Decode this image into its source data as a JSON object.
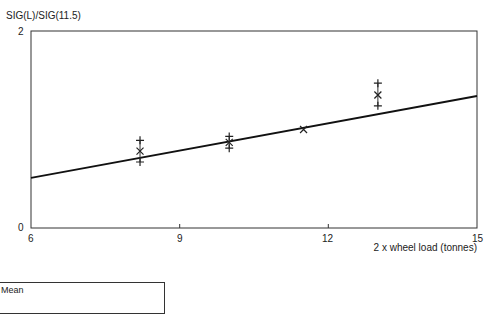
{
  "chart_data": {
    "type": "scatter",
    "title": "",
    "ylabel": "SIG(L)/SIG(11.5)",
    "xlabel": "2 x wheel load (tonnes)",
    "xlim": [
      6,
      15
    ],
    "ylim": [
      0,
      2
    ],
    "x_ticks": [
      "6",
      "9",
      "12",
      "15"
    ],
    "y_ticks": [
      "0",
      "2"
    ],
    "grid": false,
    "legend": [
      "Mean"
    ],
    "series": [
      {
        "name": "Mean",
        "marker": "x",
        "points": [
          {
            "x": 8.2,
            "y": 0.78
          },
          {
            "x": 10.0,
            "y": 0.87
          },
          {
            "x": 11.5,
            "y": 1.0
          },
          {
            "x": 13.0,
            "y": 1.35
          }
        ]
      },
      {
        "name": "Range",
        "marker": "+",
        "points": [
          {
            "x": 8.2,
            "y": 0.89
          },
          {
            "x": 8.2,
            "y": 0.67
          },
          {
            "x": 10.0,
            "y": 0.93
          },
          {
            "x": 10.0,
            "y": 0.81
          },
          {
            "x": 13.0,
            "y": 1.47
          },
          {
            "x": 13.0,
            "y": 1.24
          }
        ]
      },
      {
        "name": "Fit",
        "type": "line",
        "points": [
          {
            "x": 6,
            "y": 0.51
          },
          {
            "x": 15,
            "y": 1.34
          }
        ]
      }
    ]
  },
  "labels": {
    "ylabel": "SIG(L)/SIG(11.5)",
    "xlabel": "2 x wheel load (tonnes)",
    "y0": "0",
    "y2": "2",
    "x6": "6",
    "x9": "9",
    "x12": "12",
    "x15": "15",
    "legend_mean": "Mean"
  }
}
